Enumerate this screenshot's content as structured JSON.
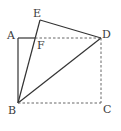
{
  "diagram": {
    "type": "geometry-figure",
    "stroke_color": "#333333",
    "dashed_color": "#555555",
    "points": {
      "A": {
        "label": "A",
        "x": 18,
        "y": 38,
        "lx": 7,
        "ly": 39
      },
      "B": {
        "label": "B",
        "x": 18,
        "y": 103,
        "lx": 8,
        "ly": 114
      },
      "C": {
        "label": "C",
        "x": 101,
        "y": 103,
        "lx": 103,
        "ly": 113
      },
      "D": {
        "label": "D",
        "x": 101,
        "y": 38,
        "lx": 102,
        "ly": 38
      },
      "E": {
        "label": "E",
        "x": 40,
        "y": 20,
        "lx": 33,
        "ly": 17
      },
      "F": {
        "label": "F",
        "x": 35,
        "y": 38,
        "lx": 37,
        "ly": 49
      }
    },
    "solid_segments": [
      "AB",
      "AF",
      "BE",
      "ED",
      "BD"
    ],
    "dashed_segments": [
      "FD",
      "DC",
      "BC"
    ]
  }
}
